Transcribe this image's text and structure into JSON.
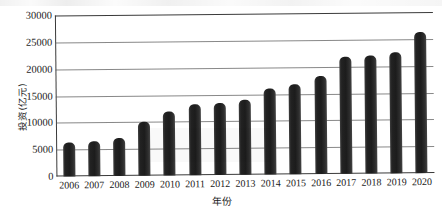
{
  "chart_data": {
    "type": "bar",
    "title": "",
    "xlabel": "年份",
    "ylabel": "投资(亿元)",
    "categories": [
      "2006",
      "2007",
      "2008",
      "2009",
      "2010",
      "2011",
      "2012",
      "2013",
      "2014",
      "2015",
      "2016",
      "2017",
      "2018",
      "2019",
      "2020"
    ],
    "values": [
      6300,
      6500,
      7000,
      10000,
      12000,
      13200,
      13500,
      14000,
      16000,
      16800,
      18200,
      21800,
      22000,
      22500,
      26300
    ],
    "ylim": [
      0,
      30000
    ],
    "ytick_labels": [
      "0",
      "5000",
      "10000",
      "15000",
      "20000",
      "25000",
      "30000"
    ],
    "ytick_values": [
      0,
      5000,
      10000,
      15000,
      20000,
      25000,
      30000
    ],
    "grid": true,
    "legend": false,
    "legend_position": "none",
    "bar_color": "#222222",
    "grid_color": "#5a5a5a",
    "axis_color": "#3a3a3a"
  }
}
